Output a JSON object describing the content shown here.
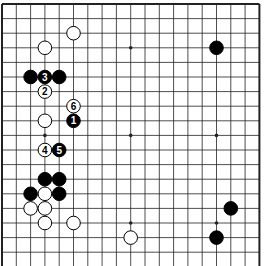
{
  "board": {
    "size": 19,
    "origin_x": 2,
    "origin_y": 4,
    "spacing_x": 14.3,
    "spacing_y": 14.6,
    "visible_rows": 18,
    "edges": {
      "left": true,
      "top": true,
      "right": true,
      "bottom": false
    },
    "colors": {
      "background": "#ffffff",
      "line": "#222222",
      "black": "#000000",
      "white": "#ffffff"
    },
    "star_points": [
      {
        "col": 3,
        "row": 3
      },
      {
        "col": 9,
        "row": 3
      },
      {
        "col": 15,
        "row": 3
      },
      {
        "col": 3,
        "row": 9
      },
      {
        "col": 9,
        "row": 9
      },
      {
        "col": 15,
        "row": 9
      },
      {
        "col": 3,
        "row": 15
      },
      {
        "col": 9,
        "row": 15
      },
      {
        "col": 15,
        "row": 15
      }
    ],
    "stones": [
      {
        "col": 5,
        "row": 2,
        "color": "white",
        "label": ""
      },
      {
        "col": 3,
        "row": 3,
        "color": "white",
        "label": ""
      },
      {
        "col": 15,
        "row": 3,
        "color": "black",
        "label": ""
      },
      {
        "col": 2,
        "row": 5,
        "color": "black",
        "label": ""
      },
      {
        "col": 3,
        "row": 5,
        "color": "black",
        "label": "3"
      },
      {
        "col": 4,
        "row": 5,
        "color": "black",
        "label": ""
      },
      {
        "col": 3,
        "row": 6,
        "color": "white",
        "label": "2"
      },
      {
        "col": 5,
        "row": 7,
        "color": "white",
        "label": "6"
      },
      {
        "col": 3,
        "row": 8,
        "color": "white",
        "label": ""
      },
      {
        "col": 5,
        "row": 8,
        "color": "black",
        "label": "1"
      },
      {
        "col": 3,
        "row": 10,
        "color": "white",
        "label": "4"
      },
      {
        "col": 4,
        "row": 10,
        "color": "black",
        "label": "5"
      },
      {
        "col": 3,
        "row": 12,
        "color": "black",
        "label": ""
      },
      {
        "col": 4,
        "row": 12,
        "color": "black",
        "label": ""
      },
      {
        "col": 2,
        "row": 13,
        "color": "black",
        "label": ""
      },
      {
        "col": 3,
        "row": 13,
        "color": "white",
        "label": ""
      },
      {
        "col": 4,
        "row": 13,
        "color": "black",
        "label": ""
      },
      {
        "col": 2,
        "row": 14,
        "color": "white",
        "label": ""
      },
      {
        "col": 3,
        "row": 14,
        "color": "white",
        "label": ""
      },
      {
        "col": 16,
        "row": 14,
        "color": "black",
        "label": ""
      },
      {
        "col": 3,
        "row": 15,
        "color": "white",
        "label": ""
      },
      {
        "col": 5,
        "row": 15,
        "color": "white",
        "label": ""
      },
      {
        "col": 9,
        "row": 16,
        "color": "white",
        "label": ""
      },
      {
        "col": 15,
        "row": 16,
        "color": "black",
        "label": ""
      }
    ]
  }
}
